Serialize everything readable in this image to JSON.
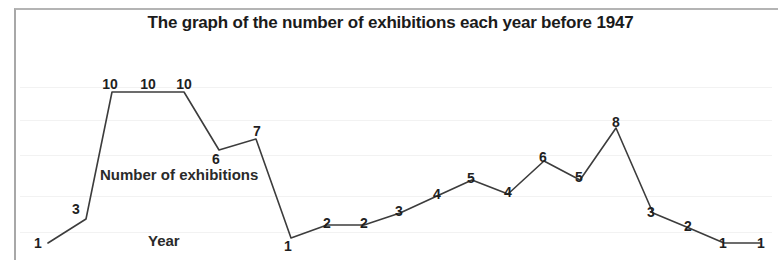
{
  "chart_data": {
    "type": "line",
    "title": "The graph of the number of exhibitions each year before 1947",
    "xlabel": "Year",
    "ylabel": "Number of exhibitions",
    "grid": true,
    "legend": null,
    "ylim": [
      0,
      11
    ],
    "series": [
      {
        "name": "Number of exhibitions",
        "values": [
          1,
          3,
          10,
          10,
          10,
          6,
          7,
          1,
          2,
          2,
          3,
          4,
          5,
          4,
          6,
          5,
          8,
          3,
          2,
          1,
          1
        ]
      }
    ],
    "point_labels": [
      "1",
      "3",
      "10",
      "10",
      "10",
      "6",
      "7",
      "1",
      "2",
      "2",
      "3",
      "4",
      "5",
      "4",
      "6",
      "5",
      "8",
      "3",
      "2",
      "1",
      "1"
    ],
    "points": [
      {
        "label": "1",
        "value": 1,
        "x": 48,
        "y": 243,
        "lx": 38,
        "ly": 243
      },
      {
        "label": "3",
        "value": 3,
        "x": 86,
        "y": 219,
        "lx": 76,
        "ly": 209
      },
      {
        "label": "10",
        "value": 10,
        "x": 112,
        "y": 92,
        "lx": 110,
        "ly": 84
      },
      {
        "label": "10",
        "value": 10,
        "x": 148,
        "y": 92,
        "lx": 148,
        "ly": 84
      },
      {
        "label": "10",
        "value": 10,
        "x": 184,
        "y": 92,
        "lx": 184,
        "ly": 84
      },
      {
        "label": "6",
        "value": 6,
        "x": 219,
        "y": 150,
        "lx": 216,
        "ly": 159
      },
      {
        "label": "7",
        "value": 7,
        "x": 256,
        "y": 139,
        "lx": 257,
        "ly": 131
      },
      {
        "label": "1",
        "value": 1,
        "x": 291,
        "y": 238,
        "lx": 288,
        "ly": 246
      },
      {
        "label": "2",
        "value": 2,
        "x": 327,
        "y": 225,
        "lx": 327,
        "ly": 223
      },
      {
        "label": "2",
        "value": 2,
        "x": 364,
        "y": 225,
        "lx": 364,
        "ly": 223
      },
      {
        "label": "3",
        "value": 3,
        "x": 400,
        "y": 213,
        "lx": 399,
        "ly": 211
      },
      {
        "label": "4",
        "value": 4,
        "x": 437,
        "y": 196,
        "lx": 437,
        "ly": 194
      },
      {
        "label": "5",
        "value": 5,
        "x": 472,
        "y": 180,
        "lx": 471,
        "ly": 178
      },
      {
        "label": "4",
        "value": 4,
        "x": 508,
        "y": 194,
        "lx": 508,
        "ly": 192
      },
      {
        "label": "6",
        "value": 6,
        "x": 544,
        "y": 161,
        "lx": 543,
        "ly": 157
      },
      {
        "label": "5",
        "value": 5,
        "x": 580,
        "y": 180,
        "lx": 579,
        "ly": 177
      },
      {
        "label": "8",
        "value": 8,
        "x": 616,
        "y": 128,
        "lx": 616,
        "ly": 122
      },
      {
        "label": "3",
        "value": 3,
        "x": 653,
        "y": 213,
        "lx": 651,
        "ly": 212
      },
      {
        "label": "2",
        "value": 2,
        "x": 689,
        "y": 228,
        "lx": 688,
        "ly": 226
      },
      {
        "label": "1",
        "value": 1,
        "x": 724,
        "y": 243,
        "lx": 723,
        "ly": 243
      },
      {
        "label": "1",
        "value": 1,
        "x": 760,
        "y": 243,
        "lx": 761,
        "ly": 243
      }
    ],
    "gridline_y": [
      87,
      120,
      155,
      196,
      232
    ],
    "line_color": "#3c3c3c",
    "label_color": "#1f1f1f",
    "title_color": "#1b1b1b",
    "background_color": "#ffffff",
    "frame_color": "#a8a8a8"
  }
}
